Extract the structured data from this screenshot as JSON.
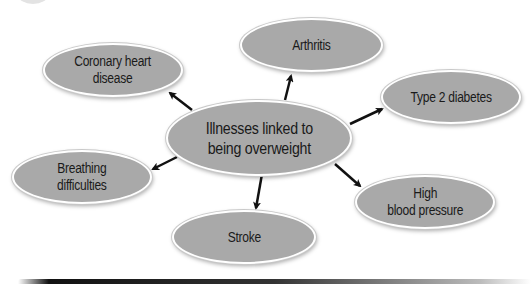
{
  "diagram": {
    "type": "spider-diagram",
    "center": {
      "label": "Illnesses linked to\nbeing overweight"
    },
    "nodes": [
      {
        "id": "coronary",
        "label": "Coronary heart\ndisease"
      },
      {
        "id": "arthritis",
        "label": "Arthritis"
      },
      {
        "id": "diabetes",
        "label": "Type 2 diabetes"
      },
      {
        "id": "breathing",
        "label": "Breathing\ndifficulties"
      },
      {
        "id": "blood-pressure",
        "label": "High\nblood pressure"
      },
      {
        "id": "stroke",
        "label": "Stroke"
      }
    ],
    "edges": [
      {
        "from": "center",
        "to": "coronary"
      },
      {
        "from": "center",
        "to": "arthritis"
      },
      {
        "from": "center",
        "to": "diabetes"
      },
      {
        "from": "center",
        "to": "breathing"
      },
      {
        "from": "center",
        "to": "blood-pressure"
      },
      {
        "from": "center",
        "to": "stroke"
      }
    ],
    "colors": {
      "node_fill": "#a9a9a9",
      "node_border": "#ffffff",
      "arrow": "#111111",
      "text": "#1a1a1a"
    }
  }
}
